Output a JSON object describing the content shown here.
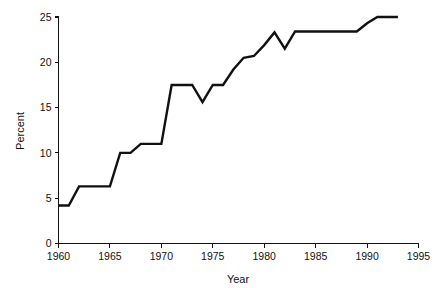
{
  "chart_data": {
    "type": "line",
    "title": "",
    "xlabel": "Year",
    "ylabel": "Percent",
    "xlim": [
      1960,
      1995
    ],
    "ylim": [
      0,
      25
    ],
    "grid": false,
    "legend": null,
    "xticks": [
      1960,
      1965,
      1970,
      1975,
      1980,
      1985,
      1990,
      1995
    ],
    "xtick_labels": [
      "1960",
      "1965",
      "1970",
      "1975",
      "1980",
      "1985",
      "1990",
      "1995"
    ],
    "yticks": [
      0,
      5,
      10,
      15,
      20,
      25
    ],
    "ytick_labels": [
      "0",
      "5",
      "10",
      "15",
      "20",
      "25"
    ],
    "line_color": "#111111",
    "series": [
      {
        "name": "Percent",
        "x": [
          1960,
          1961,
          1962,
          1963,
          1964,
          1965,
          1966,
          1967,
          1968,
          1969,
          1970,
          1971,
          1972,
          1973,
          1974,
          1975,
          1976,
          1977,
          1978,
          1979,
          1980,
          1981,
          1982,
          1983,
          1984,
          1985,
          1986,
          1987,
          1988,
          1989,
          1990,
          1991,
          1992,
          1993
        ],
        "values": [
          4.2,
          4.2,
          6.3,
          6.3,
          6.3,
          6.3,
          10.0,
          10.0,
          11.0,
          11.0,
          11.0,
          17.5,
          17.5,
          17.5,
          15.6,
          17.5,
          17.5,
          19.2,
          20.5,
          20.7,
          21.9,
          23.3,
          21.5,
          23.4,
          23.4,
          23.4,
          23.4,
          23.4,
          23.4,
          23.4,
          24.3,
          25.0,
          25.0,
          25.0
        ]
      }
    ]
  },
  "axes": {
    "y_axis_title": "Percent",
    "x_axis_title": "Year"
  }
}
